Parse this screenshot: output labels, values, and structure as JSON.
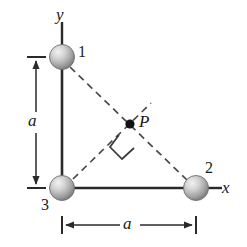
{
  "figure": {
    "background_color": "#ffffff",
    "stroke_color": "#2a2a2a",
    "dash_color": "#555555",
    "sphere_fill_light": "#e8e8e8",
    "sphere_fill_dark": "#8f8f8f",
    "width": 247,
    "height": 247
  },
  "axes": {
    "y_label": "y",
    "x_label": "x",
    "origin": {
      "x": 62,
      "y": 188
    },
    "y_axis_top": {
      "x": 62,
      "y": 22
    },
    "x_axis_right": {
      "x": 220,
      "y": 188
    }
  },
  "particles": [
    {
      "id": "particle-1",
      "label": "1",
      "cx": 62,
      "cy": 57,
      "r": 12,
      "label_x": 78,
      "label_y": 44
    },
    {
      "id": "particle-2",
      "label": "2",
      "cx": 196,
      "cy": 188,
      "r": 12,
      "label_x": 205,
      "label_y": 160
    },
    {
      "id": "particle-3",
      "label": "3",
      "cx": 62,
      "cy": 188,
      "r": 12,
      "label_x": 41,
      "label_y": 197
    }
  ],
  "field_point": {
    "label": "P",
    "x": 130,
    "y": 124,
    "dot_radius": 4.5,
    "label_x": 139,
    "label_y": 113
  },
  "dimensions": [
    {
      "id": "dim-a-vertical",
      "label": "a",
      "orientation": "vertical",
      "axis_x": 36,
      "from_y": 57,
      "to_y": 188,
      "label_x": 28,
      "label_y": 112
    },
    {
      "id": "dim-a-horizontal",
      "label": "a",
      "orientation": "horizontal",
      "axis_y": 225,
      "from_x": 62,
      "to_x": 196,
      "label_x": 123,
      "label_y": 215
    }
  ],
  "dashed_lines": [
    {
      "id": "hypotenuse-1-to-2",
      "x1": 70,
      "y1": 67,
      "x2": 187,
      "y2": 180
    },
    {
      "id": "bisector-3-through-p",
      "x1": 73,
      "y1": 179,
      "x2": 150,
      "y2": 104
    }
  ],
  "right_angle_marker": {
    "id": "right-angle-at-p",
    "points": "130,132 115,147 130,162 145,147",
    "note": "square marker indicating perpendicularity at P"
  },
  "solid_lines": [
    {
      "id": "leg-1-to-3",
      "x1": 62,
      "y1": 69,
      "x2": 62,
      "y2": 176
    },
    {
      "id": "leg-3-to-2",
      "x1": 74,
      "y1": 188,
      "x2": 184,
      "y2": 188
    }
  ]
}
